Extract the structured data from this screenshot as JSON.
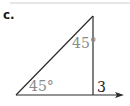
{
  "problem": {
    "label": "c."
  },
  "figure": {
    "type": "right-triangle",
    "stroke_color": "#2a2a2a",
    "angle_label_color": "#8a8a8a",
    "angles": [
      {
        "position": "top",
        "value": "45°"
      },
      {
        "position": "bottom-left",
        "value": "45°"
      }
    ],
    "sides": [
      {
        "position": "vertical-leg",
        "value": "3"
      }
    ],
    "baseline_arrow": true
  }
}
